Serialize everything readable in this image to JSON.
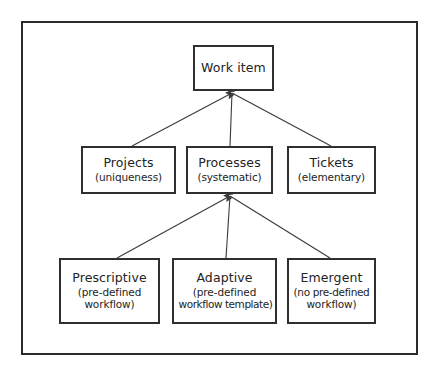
{
  "figure": {
    "name": "Work item hierarchy diagram",
    "background_color": "#ffffff",
    "frame_color": "#2b2b2b",
    "box_border_color": "#2f2f2f",
    "text_color": "#242424",
    "edge_color": "#3a3a3a"
  },
  "nodes": {
    "work_item": {
      "title": "Work item",
      "subtitle": ""
    },
    "projects": {
      "title": "Projects",
      "subtitle": "(uniqueness)"
    },
    "processes": {
      "title": "Processes",
      "subtitle": "(systematic)"
    },
    "tickets": {
      "title": "Tickets",
      "subtitle": "(elementary)"
    },
    "prescriptive": {
      "title": "Prescriptive",
      "subtitle_line1": "(pre-defined",
      "subtitle_line2": "workflow)"
    },
    "adaptive": {
      "title": "Adaptive",
      "subtitle_line1": "(pre-defined",
      "subtitle_line2": "workflow template)"
    },
    "emergent": {
      "title": "Emergent",
      "subtitle_line1": "(no pre-defined",
      "subtitle_line2": "workflow)"
    }
  },
  "edges": [
    {
      "from": "projects",
      "to": "work_item",
      "arrow": true
    },
    {
      "from": "processes",
      "to": "work_item",
      "arrow": true
    },
    {
      "from": "tickets",
      "to": "work_item",
      "arrow": true
    },
    {
      "from": "prescriptive",
      "to": "processes",
      "arrow": true
    },
    {
      "from": "adaptive",
      "to": "processes",
      "arrow": true
    },
    {
      "from": "emergent",
      "to": "processes",
      "arrow": true
    }
  ]
}
